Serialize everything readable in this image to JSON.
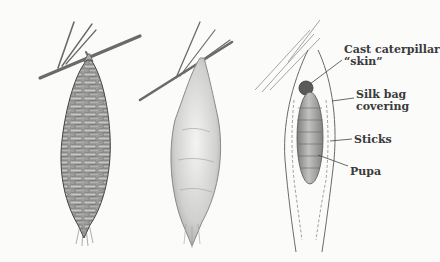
{
  "diagram": {
    "panels": [
      {
        "id": "stick-case",
        "description": "Bagworm case covered in sticks hanging from pine twig"
      },
      {
        "id": "silk-case",
        "description": "Bagworm case covered in silk hanging from twig"
      },
      {
        "id": "cutaway",
        "description": "Cutaway view showing pupa inside case"
      }
    ],
    "labels": [
      {
        "id": "cast-skin",
        "text": "Cast caterpillar\n“skin”"
      },
      {
        "id": "silk-bag",
        "text": "Silk bag\ncovering"
      },
      {
        "id": "sticks",
        "text": "Sticks"
      },
      {
        "id": "pupa",
        "text": "Pupa"
      }
    ],
    "colors": {
      "background": "#fbfbfa",
      "ink": "#3a3a3a",
      "stick_fill": "#8f8f8f",
      "silk_fill": "#d8d8d6",
      "pupa_fill": "#9a9a98"
    }
  }
}
